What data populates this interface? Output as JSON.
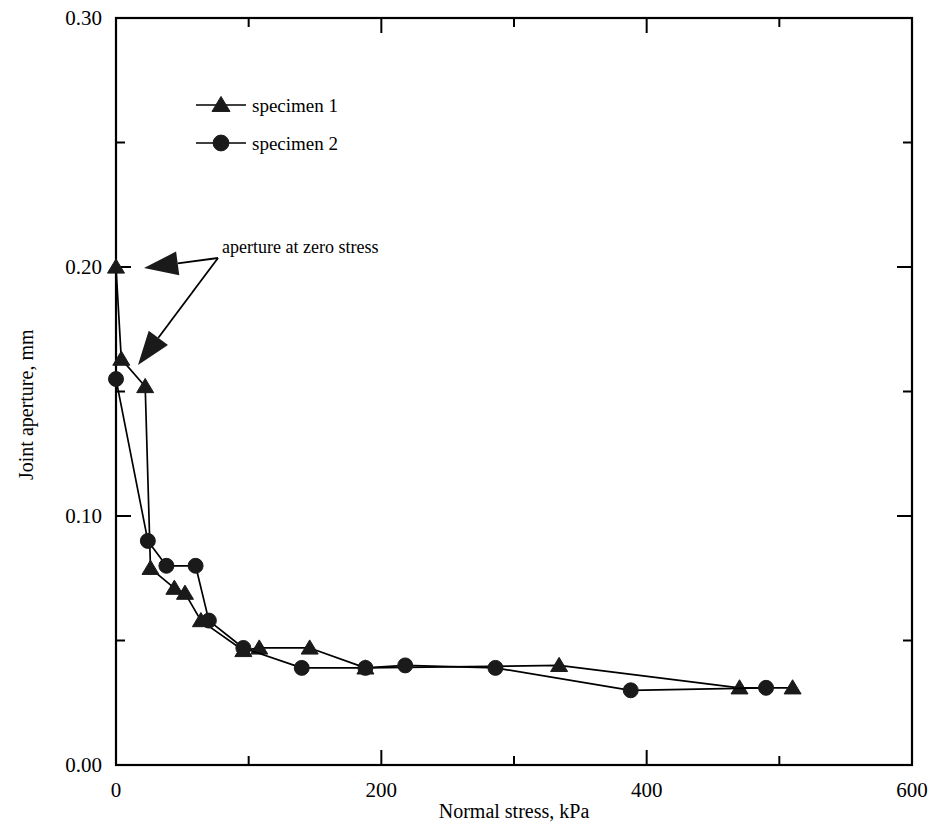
{
  "chart_data": {
    "type": "line",
    "title": "",
    "subtitle": "",
    "xlabel": "Normal stress, kPa",
    "ylabel": "Joint aperture, mm",
    "xlim": [
      0,
      600
    ],
    "ylim": [
      0.0,
      0.3
    ],
    "grid": false,
    "legend_position": "upper-left-inside",
    "x_major_ticks": [
      0,
      200,
      400,
      600
    ],
    "x_major_tick_labels": [
      "0",
      "200",
      "400",
      "600"
    ],
    "x_minor_ticks": [
      100,
      300,
      500
    ],
    "y_major_ticks": [
      0.0,
      0.1,
      0.2,
      0.3
    ],
    "y_major_tick_labels": [
      "0.00",
      "0.10",
      "0.20",
      "0.30"
    ],
    "y_minor_ticks": [
      0.05,
      0.15,
      0.25
    ],
    "series": [
      {
        "name": "specimen 1",
        "marker": "triangle",
        "x": [
          0,
          4,
          22,
          26,
          44,
          52,
          64,
          96,
          108,
          146,
          188,
          334,
          470,
          510
        ],
        "y": [
          0.2,
          0.163,
          0.152,
          0.079,
          0.071,
          0.069,
          0.058,
          0.046,
          0.047,
          0.047,
          0.039,
          0.04,
          0.031,
          0.031
        ]
      },
      {
        "name": "specimen 2",
        "marker": "circle",
        "x": [
          0,
          24,
          38,
          60,
          70,
          96,
          140,
          188,
          218,
          286,
          388,
          490
        ],
        "y": [
          0.155,
          0.09,
          0.08,
          0.08,
          0.058,
          0.047,
          0.039,
          0.039,
          0.04,
          0.039,
          0.03,
          0.031
        ]
      }
    ],
    "annotations": [
      {
        "text": "aperture at zero stress",
        "points_to": [
          {
            "x": 0,
            "y": 0.2
          },
          {
            "x": 0,
            "y": 0.155
          }
        ]
      }
    ]
  },
  "axes": {
    "y_title": "Joint aperture, mm",
    "x_title": "Normal stress, kPa",
    "y_labels": [
      "0.30",
      "0.20",
      "0.10",
      "0.00"
    ],
    "x_labels": [
      "0",
      "200",
      "400",
      "600"
    ]
  },
  "legend": {
    "entries": [
      {
        "label": "specimen 1",
        "marker": "triangle-icon"
      },
      {
        "label": "specimen 2",
        "marker": "circle-icon"
      }
    ]
  },
  "annotation": {
    "text": "aperture at zero stress"
  }
}
